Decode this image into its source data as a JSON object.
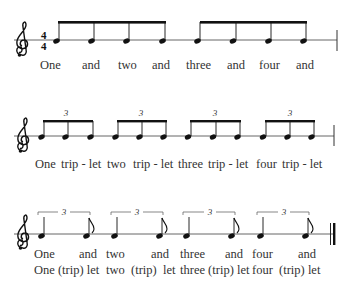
{
  "colors": {
    "ink": "#111111",
    "staff": "#555555",
    "text": "#333333"
  },
  "time_signature": {
    "top": "4",
    "bottom": "4"
  },
  "clef": "treble-clef",
  "rows": [
    {
      "id": "eighths",
      "staff_y": 40,
      "lyrics": [
        {
          "text": "One",
          "x": 40
        },
        {
          "text": "and",
          "x": 82
        },
        {
          "text": "two",
          "x": 118
        },
        {
          "text": "and",
          "x": 152
        },
        {
          "text": "three",
          "x": 186
        },
        {
          "text": "and",
          "x": 227
        },
        {
          "text": "four",
          "x": 259
        },
        {
          "text": "and",
          "x": 296
        }
      ]
    },
    {
      "id": "triplets",
      "staff_y": 136,
      "tuplet_label": "3",
      "lyrics": [
        {
          "text": "One",
          "x": 35
        },
        {
          "text": "trip - let",
          "x": 61
        },
        {
          "text": "two",
          "x": 107
        },
        {
          "text": "trip - let",
          "x": 133
        },
        {
          "text": "three",
          "x": 178
        },
        {
          "text": "trip - let",
          "x": 208
        },
        {
          "text": "four",
          "x": 256
        },
        {
          "text": "trip - let",
          "x": 282
        }
      ]
    },
    {
      "id": "swing",
      "staff_y": 234,
      "tuplet_label": "3",
      "lyrics_line1": [
        {
          "text": "One",
          "x": 34
        },
        {
          "text": "and",
          "x": 79
        },
        {
          "text": "two",
          "x": 106
        },
        {
          "text": "and",
          "x": 151
        },
        {
          "text": "three",
          "x": 180
        },
        {
          "text": "and",
          "x": 225
        },
        {
          "text": "four",
          "x": 252
        },
        {
          "text": "and",
          "x": 298
        }
      ],
      "lyrics_line2": [
        {
          "text": "One (trip) let",
          "x": 34
        },
        {
          "text": "two  (trip)  let",
          "x": 106
        },
        {
          "text": "three (trip) let",
          "x": 180
        },
        {
          "text": "four  (trip) let",
          "x": 252
        }
      ]
    }
  ]
}
